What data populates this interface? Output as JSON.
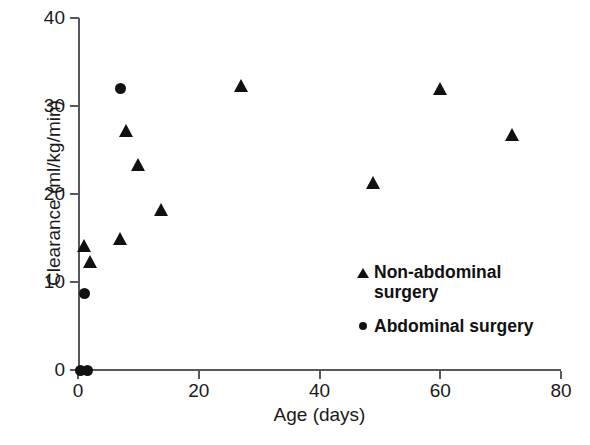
{
  "chart_data": {
    "type": "scatter",
    "title": "",
    "xlabel": "Age (days)",
    "ylabel": "Clearance (ml/kg/min)",
    "xlim": [
      0,
      80
    ],
    "ylim": [
      0,
      40
    ],
    "xticks": [
      "0",
      "20",
      "40",
      "60",
      "80"
    ],
    "yticks": [
      "0",
      "10",
      "20",
      "30",
      "40"
    ],
    "xtick_values": [
      0,
      20,
      40,
      60,
      80
    ],
    "ytick_values": [
      0,
      10,
      20,
      30,
      40
    ],
    "grid": false,
    "legend_position": "inside-lower-right",
    "series": [
      {
        "name": "Non-abdominal surgery",
        "marker": "triangle",
        "color": "#111111",
        "points": [
          {
            "x": 1.0,
            "y": 14.2
          },
          {
            "x": 2.0,
            "y": 12.3
          },
          {
            "x": 7.0,
            "y": 14.9
          },
          {
            "x": 8.0,
            "y": 27.2
          },
          {
            "x": 10.0,
            "y": 23.3
          },
          {
            "x": 13.8,
            "y": 18.2
          },
          {
            "x": 27.0,
            "y": 32.3
          },
          {
            "x": 49.0,
            "y": 21.3
          },
          {
            "x": 60.0,
            "y": 32.0
          },
          {
            "x": 72.0,
            "y": 26.8
          }
        ]
      },
      {
        "name": "Abdominal surgery",
        "marker": "circle",
        "color": "#111111",
        "points": [
          {
            "x": 0.4,
            "y": 0.0
          },
          {
            "x": 1.6,
            "y": 0.0
          },
          {
            "x": 1.0,
            "y": 8.7
          },
          {
            "x": 7.0,
            "y": 32.0
          }
        ]
      }
    ]
  },
  "legend": {
    "items": [
      {
        "marker": "triangle",
        "label": "Non-abdominal\nsurgery"
      },
      {
        "marker": "circle",
        "label": "Abdominal surgery"
      }
    ]
  },
  "axes": {
    "x_title": "Age (days)",
    "y_title": "Clearance (ml/kg/min)",
    "axis_color": "#58585a"
  }
}
